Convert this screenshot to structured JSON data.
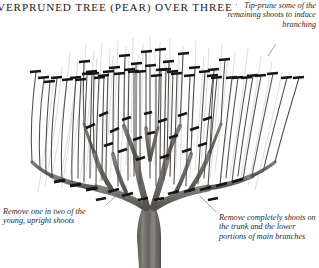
{
  "figure": {
    "title": "VERPRUNED TREE (PEAR) OVER THREE YEARS",
    "title_note": "left-clipped heading",
    "background_color": "#fefefe",
    "ink_color": "#3a3a3a",
    "mark_color": "#1a1a1a",
    "trunk_color": "#7d7a76"
  },
  "captions": {
    "tip_prune": "Tip-prune some of the remaining shoots to induce branching",
    "remove_half": "Remove one in two of the young, upright shoots",
    "remove_trunk": "Remove completely shoots on the trunk and the lower portions of main branches"
  },
  "diagram_data": {
    "type": "illustration",
    "elements": [
      {
        "name": "trunk",
        "role": "main stem"
      },
      {
        "name": "main-branches",
        "role": "scaffold limbs"
      },
      {
        "name": "water-shoots",
        "role": "young upright shoots"
      },
      {
        "name": "pruning-marks",
        "role": "cut indicators",
        "count": 64
      }
    ]
  }
}
